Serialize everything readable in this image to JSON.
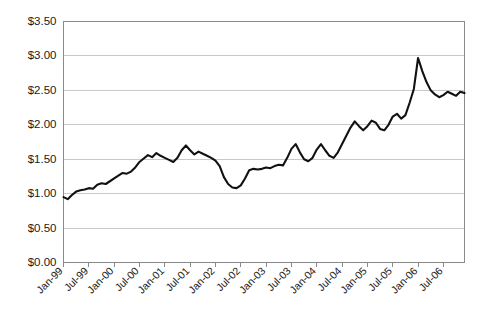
{
  "chart_data": {
    "type": "line",
    "title": "",
    "subtitle": "",
    "xlabel": "",
    "ylabel": "",
    "ylim": [
      0.0,
      3.5
    ],
    "ytick_values": [
      0.0,
      0.5,
      1.0,
      1.5,
      2.0,
      2.5,
      3.0,
      3.5
    ],
    "ytick_labels": [
      "$0.00",
      "$0.50",
      "$1.00",
      "$1.50",
      "$2.00",
      "$2.50",
      "$3.00",
      "$3.50"
    ],
    "y_tick_prefix": "$",
    "grid": true,
    "grid_axis": "y",
    "legend": "none",
    "xtick_labels": [
      "Jan-99",
      "Jul-99",
      "Jan-00",
      "Jul-00",
      "Jan-01",
      "Jul-01",
      "Jan-02",
      "Jul-02",
      "Jan-03",
      "Jul-03",
      "Jan-04",
      "Jul-04",
      "Jan-05",
      "Jul-05",
      "Jan-06",
      "Jul-06"
    ],
    "x_tick_interval_months": 6,
    "x_start": "Jan-99",
    "x_end": "Dec-06",
    "series": [
      {
        "name": "Price",
        "color": "#111111",
        "x": [
          "Jan-99",
          "Feb-99",
          "Mar-99",
          "Apr-99",
          "May-99",
          "Jun-99",
          "Jul-99",
          "Aug-99",
          "Sep-99",
          "Oct-99",
          "Nov-99",
          "Dec-99",
          "Jan-00",
          "Feb-00",
          "Mar-00",
          "Apr-00",
          "May-00",
          "Jun-00",
          "Jul-00",
          "Aug-00",
          "Sep-00",
          "Oct-00",
          "Nov-00",
          "Dec-00",
          "Jan-01",
          "Feb-01",
          "Mar-01",
          "Apr-01",
          "May-01",
          "Jun-01",
          "Jul-01",
          "Aug-01",
          "Sep-01",
          "Oct-01",
          "Nov-01",
          "Dec-01",
          "Jan-02",
          "Feb-02",
          "Mar-02",
          "Apr-02",
          "May-02",
          "Jun-02",
          "Jul-02",
          "Aug-02",
          "Sep-02",
          "Oct-02",
          "Nov-02",
          "Dec-02",
          "Jan-03",
          "Feb-03",
          "Mar-03",
          "Apr-03",
          "May-03",
          "Jun-03",
          "Jul-03",
          "Aug-03",
          "Sep-03",
          "Oct-03",
          "Nov-03",
          "Dec-03",
          "Jan-04",
          "Feb-04",
          "Mar-04",
          "Apr-04",
          "May-04",
          "Jun-04",
          "Jul-04",
          "Aug-04",
          "Sep-04",
          "Oct-04",
          "Nov-04",
          "Dec-04",
          "Jan-05",
          "Feb-05",
          "Mar-05",
          "Apr-05",
          "May-05",
          "Jun-05",
          "Jul-05",
          "Aug-05",
          "Sep-05",
          "Oct-05",
          "Nov-05",
          "Dec-05",
          "Jan-06",
          "Feb-06",
          "Mar-06",
          "Apr-06",
          "May-06",
          "Jun-06",
          "Jul-06",
          "Aug-06",
          "Sep-06",
          "Oct-06",
          "Nov-06",
          "Dec-06"
        ],
        "values": [
          0.95,
          0.92,
          0.98,
          1.03,
          1.05,
          1.06,
          1.08,
          1.07,
          1.13,
          1.15,
          1.14,
          1.18,
          1.22,
          1.26,
          1.3,
          1.29,
          1.32,
          1.38,
          1.46,
          1.51,
          1.56,
          1.53,
          1.59,
          1.55,
          1.52,
          1.49,
          1.46,
          1.52,
          1.63,
          1.7,
          1.63,
          1.57,
          1.61,
          1.58,
          1.55,
          1.52,
          1.48,
          1.4,
          1.24,
          1.14,
          1.09,
          1.08,
          1.12,
          1.22,
          1.34,
          1.36,
          1.35,
          1.36,
          1.38,
          1.37,
          1.4,
          1.42,
          1.41,
          1.52,
          1.65,
          1.72,
          1.6,
          1.5,
          1.47,
          1.52,
          1.64,
          1.72,
          1.63,
          1.55,
          1.52,
          1.6,
          1.72,
          1.84,
          1.96,
          2.05,
          1.98,
          1.92,
          1.98,
          2.06,
          2.03,
          1.94,
          1.92,
          2.0,
          2.12,
          2.16,
          2.09,
          2.14,
          2.32,
          2.52,
          2.97,
          2.78,
          2.62,
          2.5,
          2.44,
          2.4,
          2.43,
          2.48,
          2.45,
          2.42,
          2.48,
          2.46
        ]
      }
    ]
  },
  "axes": {
    "y_axis_name": "price-axis",
    "x_axis_name": "date-axis"
  }
}
